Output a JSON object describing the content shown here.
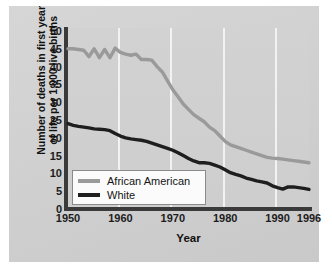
{
  "chart_data": {
    "type": "line",
    "title": "",
    "xlabel": "Year",
    "ylabel": "Number of deaths in first year of life per 1,000 live births",
    "ylabel_line1": "Number of deaths in first year",
    "ylabel_line2": "of life per 1,000 live births",
    "xlim": [
      1950,
      1996
    ],
    "ylim": [
      0,
      50
    ],
    "yticks": [
      50,
      45,
      40,
      35,
      30,
      25,
      20,
      15,
      10,
      5,
      0
    ],
    "xticks": [
      1950,
      1960,
      1970,
      1980,
      1990,
      1996
    ],
    "xtick_labels": [
      "1950",
      "1960",
      "1970",
      "1980",
      "1990",
      "1996"
    ],
    "grid": "vertical-white-gridlines-at-1960-1970-1980-1990",
    "legend_position": "lower-left-inside",
    "colors": {
      "african_american": "#9a9a9a",
      "white": "#1e1e1e",
      "plot_background": "#cdcdcd",
      "figure_background": "#d2d2d2",
      "gridline": "#f2f2f2",
      "axis": "#3a3a3a"
    },
    "x": [
      1950,
      1951,
      1952,
      1953,
      1954,
      1955,
      1956,
      1957,
      1958,
      1959,
      1960,
      1961,
      1962,
      1963,
      1964,
      1965,
      1966,
      1967,
      1968,
      1969,
      1970,
      1971,
      1972,
      1973,
      1974,
      1975,
      1976,
      1977,
      1978,
      1979,
      1980,
      1981,
      1982,
      1983,
      1984,
      1985,
      1986,
      1987,
      1988,
      1989,
      1990,
      1991,
      1992,
      1993,
      1994,
      1995,
      1996
    ],
    "series": [
      {
        "name": "African American",
        "color": "#9a9a9a",
        "values": [
          45.0,
          45.0,
          44.8,
          44.6,
          42.8,
          45.0,
          42.5,
          44.8,
          42.5,
          45.2,
          44.0,
          43.5,
          43.2,
          43.5,
          42.0,
          42.0,
          41.8,
          40.0,
          38.5,
          36.0,
          33.5,
          31.5,
          29.5,
          28.0,
          26.5,
          25.5,
          24.5,
          23.0,
          22.0,
          20.5,
          19.0,
          18.0,
          17.5,
          17.0,
          16.5,
          16.0,
          15.5,
          15.0,
          14.5,
          14.3,
          14.2,
          14.0,
          13.8,
          13.6,
          13.4,
          13.2,
          13.0
        ]
      },
      {
        "name": "White",
        "color": "#1e1e1e",
        "values": [
          24.0,
          23.5,
          23.2,
          23.0,
          22.8,
          22.5,
          22.4,
          22.3,
          22.0,
          21.2,
          20.5,
          20.0,
          19.7,
          19.5,
          19.3,
          19.0,
          18.5,
          18.0,
          17.5,
          17.0,
          16.5,
          15.8,
          15.0,
          14.2,
          13.5,
          13.0,
          13.0,
          12.8,
          12.3,
          11.8,
          11.0,
          10.2,
          9.7,
          9.3,
          8.7,
          8.3,
          7.9,
          7.6,
          7.3,
          6.5,
          6.0,
          5.6,
          6.2,
          6.2,
          6.0,
          5.8,
          5.5
        ]
      }
    ],
    "legend": [
      {
        "label": "African American",
        "color": "#9a9a9a"
      },
      {
        "label": "White",
        "color": "#1e1e1e"
      }
    ]
  }
}
